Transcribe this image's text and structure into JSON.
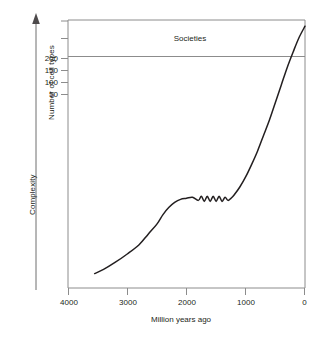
{
  "chart_data": {
    "type": "line",
    "title": "",
    "xlabel": "Million years ago",
    "ylabel": "Number of cell types",
    "axis_arrow_label": "Complexity",
    "xlim": [
      4000,
      0
    ],
    "ylim": [
      0,
      260
    ],
    "x_ticks": [
      4000,
      3000,
      2000,
      1000,
      0
    ],
    "x_tick_labels": [
      "4000",
      "3000",
      "2000",
      "1000",
      "0"
    ],
    "y_ticks": [
      50,
      100,
      150,
      200,
      250,
      300
    ],
    "y_tick_labels": [
      "50",
      "100",
      "150",
      "200",
      "",
      ""
    ],
    "grid": false,
    "legend": "none",
    "annotations": [
      {
        "name": "societies-band-label",
        "text": "Societies",
        "x": 2050,
        "y": 243
      }
    ],
    "reference_lines": [
      {
        "name": "societies-threshold-line",
        "orientation": "horizontal",
        "value": 212,
        "color": "#8c8c8c"
      }
    ],
    "series": [
      {
        "name": "complexity-curve",
        "color": "#231f20",
        "points": [
          [
            3550,
            14
          ],
          [
            3400,
            18
          ],
          [
            3200,
            25
          ],
          [
            3000,
            33
          ],
          [
            2800,
            42
          ],
          [
            2650,
            52
          ],
          [
            2500,
            62
          ],
          [
            2400,
            71
          ],
          [
            2300,
            78
          ],
          [
            2200,
            83
          ],
          [
            2100,
            86
          ],
          [
            2000,
            87
          ],
          [
            1900,
            88
          ],
          [
            1800,
            85
          ],
          [
            1750,
            89
          ],
          [
            1700,
            84
          ],
          [
            1650,
            89
          ],
          [
            1600,
            84
          ],
          [
            1550,
            89
          ],
          [
            1500,
            84
          ],
          [
            1450,
            89
          ],
          [
            1400,
            84
          ],
          [
            1350,
            88
          ],
          [
            1300,
            85
          ],
          [
            1250,
            87
          ],
          [
            1200,
            90
          ],
          [
            1100,
            98
          ],
          [
            1000,
            108
          ],
          [
            900,
            120
          ],
          [
            800,
            133
          ],
          [
            700,
            148
          ],
          [
            600,
            163
          ],
          [
            500,
            180
          ],
          [
            400,
            197
          ],
          [
            300,
            214
          ],
          [
            200,
            229
          ],
          [
            100,
            243
          ],
          [
            0,
            254
          ]
        ]
      }
    ]
  },
  "axes": {
    "frame_color": "#8c8c8c",
    "tick_color": "#8c8c8c",
    "curve_color": "#231f20"
  }
}
